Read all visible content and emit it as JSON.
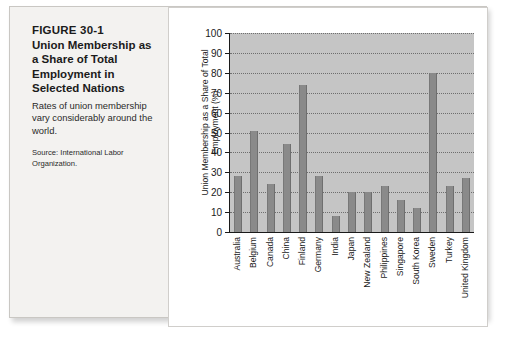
{
  "figure": {
    "number": "FIGURE 30-1",
    "title": "Union Membership as a Share of Total Employment in Selected Nations",
    "description": "Rates of union membership vary considerably around the world.",
    "source": "Source: International Labor Organization."
  },
  "chart_data": {
    "type": "bar",
    "title": "",
    "xlabel": "",
    "ylabel": "Union Membership as a Share of Total Employment (%)",
    "ylim": [
      0,
      100
    ],
    "ytick_step": 10,
    "yticks": [
      0,
      10,
      20,
      30,
      40,
      50,
      60,
      70,
      80,
      90,
      100
    ],
    "grid": true,
    "legend": "none",
    "categories": [
      "Australia",
      "Belgium",
      "Canada",
      "China",
      "Finland",
      "Germany",
      "India",
      "Japan",
      "New Zealand",
      "Philippines",
      "Singapore",
      "South Korea",
      "Sweden",
      "Turkey",
      "United Kingdom"
    ],
    "values": [
      28,
      51,
      24,
      44,
      74,
      28,
      8,
      20,
      20,
      23,
      16,
      12,
      80,
      23,
      27
    ],
    "colors": {
      "bar": "#8a8a8a",
      "plot_background": "#c5c5c5",
      "gridline": "#6e6e6e",
      "axis": "#1a1a1a",
      "card_background": "#ffffff",
      "plate_background": "#f3f2f0",
      "text": "#1b1b1b"
    }
  }
}
